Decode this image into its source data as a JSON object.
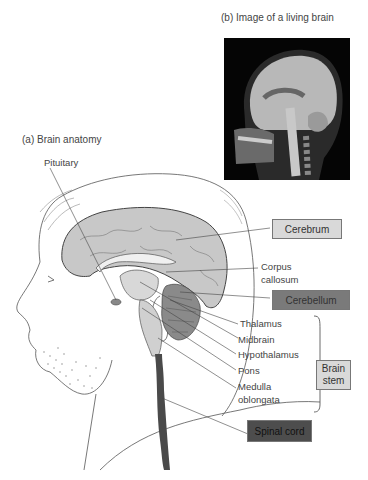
{
  "panel_b": {
    "caption": "(b) Image of a living brain"
  },
  "panel_a": {
    "caption": "(a) Brain anatomy"
  },
  "labels": {
    "pituitary": "Pituitary",
    "cerebrum": "Cerebrum",
    "corpus_callosum_1": "Corpus",
    "corpus_callosum_2": "callosum",
    "cerebellum": "Cerebellum",
    "thalamus": "Thalamus",
    "midbrain": "Midbrain",
    "hypothalamus": "Hypothalamus",
    "pons": "Pons",
    "medulla_1": "Medulla",
    "medulla_2": "oblongata",
    "brain_stem_1": "Brain",
    "brain_stem_2": "stem",
    "spinal_cord": "Spinal cord"
  },
  "colors": {
    "cerebrum_fill": "#c8c8c8",
    "cerebellum_fill": "#8a8a8a",
    "spinal_cord_fill": "#4a4a4a",
    "light_box": "#d9d9d9",
    "dark_box": "#7a7a7a",
    "spinal_box": "#4d4d4d"
  }
}
